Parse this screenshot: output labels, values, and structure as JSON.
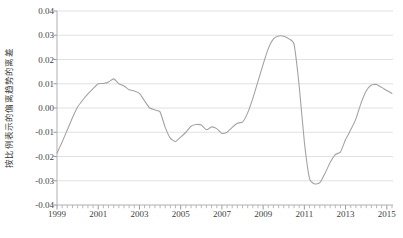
{
  "chart_data": {
    "type": "line",
    "title": "",
    "subtitle": "",
    "xlabel": "",
    "ylabel": "按比例表示的偏离趋势的离差",
    "xlim": [
      1999.0,
      2015.3
    ],
    "ylim": [
      -0.04,
      0.04
    ],
    "grid": true,
    "legend": null,
    "y_ticks": [
      0.04,
      0.03,
      0.02,
      0.01,
      0.0,
      -0.01,
      -0.02,
      -0.03,
      -0.04
    ],
    "y_tick_labels": [
      "0.04",
      "0.03",
      "0.02",
      "0.01",
      "0.00",
      "-0.01",
      "-0.02",
      "-0.03",
      "-0.04"
    ],
    "x_ticks": [
      1999,
      2001,
      2003,
      2005,
      2007,
      2009,
      2011,
      2013,
      2015
    ],
    "x_tick_labels": [
      "1999",
      "2001",
      "2003",
      "2005",
      "2007",
      "2009",
      "2011",
      "2013",
      "2015"
    ],
    "x_minor_tick_step": 0.25,
    "line_color": "#a3a3a3",
    "grid_color": "#d9d9d9",
    "axis_color": "#b0b0b0",
    "series": [
      {
        "name": "deviation-from-trend",
        "x": [
          1999.0,
          1999.25,
          1999.5,
          1999.75,
          2000.0,
          2000.25,
          2000.5,
          2000.75,
          2001.0,
          2001.25,
          2001.5,
          2001.75,
          2002.0,
          2002.25,
          2002.5,
          2002.75,
          2003.0,
          2003.25,
          2003.5,
          2003.75,
          2004.0,
          2004.25,
          2004.5,
          2004.75,
          2005.0,
          2005.25,
          2005.5,
          2005.75,
          2006.0,
          2006.25,
          2006.5,
          2006.75,
          2007.0,
          2007.25,
          2007.5,
          2007.75,
          2008.0,
          2008.25,
          2008.5,
          2008.75,
          2009.0,
          2009.25,
          2009.5,
          2009.75,
          2010.0,
          2010.25,
          2010.5,
          2010.75,
          2011.0,
          2011.25,
          2011.5,
          2011.75,
          2012.0,
          2012.25,
          2012.5,
          2012.75,
          2013.0,
          2013.25,
          2013.5,
          2013.75,
          2014.0,
          2014.25,
          2014.5,
          2014.75,
          2015.0,
          2015.25
        ],
        "values": [
          -0.0186,
          -0.014,
          -0.009,
          -0.004,
          0.0004,
          0.0033,
          0.0058,
          0.008,
          0.01,
          0.0101,
          0.0107,
          0.012,
          0.01,
          0.0091,
          0.0075,
          0.007,
          0.006,
          0.0029,
          0.0,
          -0.0008,
          -0.0016,
          -0.008,
          -0.0125,
          -0.0138,
          -0.012,
          -0.01,
          -0.0075,
          -0.0068,
          -0.007,
          -0.009,
          -0.0078,
          -0.0085,
          -0.0105,
          -0.01,
          -0.008,
          -0.0063,
          -0.0058,
          -0.002,
          0.004,
          0.011,
          0.018,
          0.0245,
          0.0285,
          0.0297,
          0.0296,
          0.0285,
          0.0262,
          0.009,
          -0.014,
          -0.029,
          -0.0313,
          -0.0308,
          -0.027,
          -0.0225,
          -0.0192,
          -0.0182,
          -0.013,
          -0.009,
          -0.0045,
          0.002,
          0.007,
          0.0095,
          0.0097,
          0.0085,
          0.0072,
          0.006
        ]
      }
    ],
    "annotations": [],
    "key_points": {
      "start_1999": -0.0186,
      "local_peak_2001": 0.012,
      "trough_2003_75": -0.0138,
      "peak_2008_75": 0.0297,
      "trough_2009_50": -0.0313,
      "peak_2011_25": 0.0097,
      "trough_2013_25": -0.0085,
      "end_2015": 0.0097
    }
  },
  "plot_geometry": {
    "left": 57,
    "right": 393,
    "top": 11,
    "bottom": 205
  }
}
